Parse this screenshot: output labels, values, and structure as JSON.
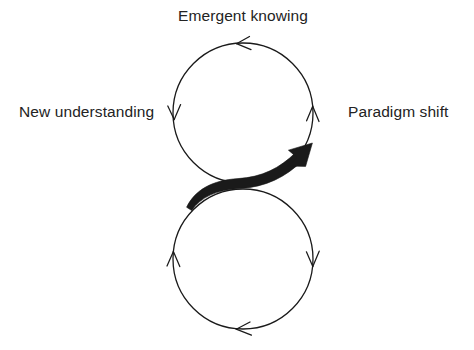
{
  "diagram": {
    "type": "cycle-diagram",
    "title_visible": false,
    "background_color": "#ffffff",
    "stroke_color": "#1a1a1a",
    "text_color": "#232323",
    "labels": {
      "top": "Emergent knowing",
      "left": "New understanding",
      "right": "Paradigm shift"
    },
    "shapes": {
      "upper_circle": {
        "name": "upper-cycle-circle",
        "center_x": 243,
        "center_y": 113,
        "radius": 70,
        "stroke_width": 1.3,
        "direction": "counterclockwise"
      },
      "lower_circle": {
        "name": "lower-cycle-circle",
        "center_x": 243,
        "center_y": 259,
        "radius": 70,
        "stroke_width": 1.3,
        "direction": "clockwise"
      }
    },
    "arrowheads": [
      {
        "name": "upper-circle-top-arrowhead",
        "x": 243,
        "y": 43,
        "points": "left"
      },
      {
        "name": "upper-circle-left-arrowhead",
        "x": 174,
        "y": 113,
        "points": "down"
      },
      {
        "name": "upper-circle-right-arrowhead",
        "x": 313,
        "y": 113,
        "points": "up"
      },
      {
        "name": "lower-circle-left-arrowhead",
        "x": 173,
        "y": 259,
        "points": "up"
      },
      {
        "name": "lower-circle-right-arrowhead",
        "x": 313,
        "y": 259,
        "points": "down"
      },
      {
        "name": "lower-circle-bottom-arrowhead",
        "x": 243,
        "y": 329,
        "points": "left"
      }
    ],
    "bold_arrow": {
      "name": "bold-transition-arrow",
      "from_x": 186,
      "from_y": 206,
      "to_x": 312,
      "to_y": 144,
      "max_thickness": 9,
      "direction": "lower-left-to-upper-right"
    }
  }
}
